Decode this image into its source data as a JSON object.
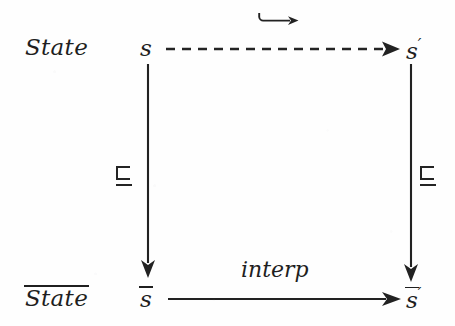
{
  "figure": {
    "kind": "commutative-diagram",
    "background_color": "#fefefe",
    "ink_color": "#1f1f1f"
  },
  "row_labels": {
    "top": "State",
    "bottom": "State",
    "bottom_has_overline": true
  },
  "nodes": {
    "top_left": {
      "base": "s",
      "overline": false,
      "prime": ""
    },
    "top_right": {
      "base": "s",
      "overline": false,
      "prime": "′"
    },
    "bottom_left": {
      "base": "s",
      "overline": true,
      "prime": ""
    },
    "bottom_right": {
      "base": "s",
      "overline": true,
      "prime": "′"
    }
  },
  "edges": {
    "top": {
      "from": "top_left",
      "to": "top_right",
      "style": "dashed",
      "direction": "right",
      "label": "↪",
      "label_name": "hookrightarrow"
    },
    "bottom": {
      "from": "bottom_left",
      "to": "bottom_right",
      "style": "solid",
      "direction": "right",
      "label": "interp",
      "label_name": "interp"
    },
    "left": {
      "from": "top_left",
      "to": "bottom_left",
      "style": "solid",
      "direction": "down",
      "label": "⊑",
      "label_name": "sqsubseteq"
    },
    "right": {
      "from": "top_right",
      "to": "bottom_right",
      "style": "solid",
      "direction": "down",
      "label": "⊑",
      "label_name": "sqsubseteq"
    }
  }
}
